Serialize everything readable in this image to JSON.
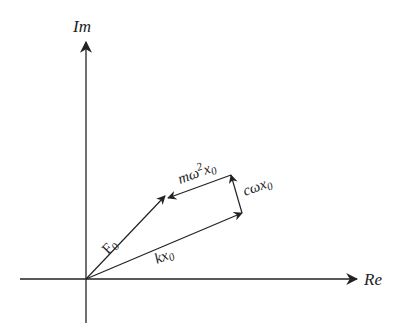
{
  "diagram": {
    "type": "phasor-diagram",
    "axes": {
      "imaginary_label": "Im",
      "real_label": "Re"
    },
    "vectors": [
      {
        "id": "F0",
        "label_main": "F",
        "label_sub": "0",
        "from": [
          86,
          279
        ],
        "to": [
          165,
          196
        ]
      },
      {
        "id": "kx0",
        "label_main": "kx",
        "label_sub": "0",
        "from": [
          86,
          279
        ],
        "to": [
          242,
          213
        ]
      },
      {
        "id": "cwx0",
        "label_main": "cωx",
        "label_sub": "0",
        "from": [
          242,
          213
        ],
        "to": [
          231,
          175
        ]
      },
      {
        "id": "mw2x0",
        "label_main": "mω",
        "label_sup": "2",
        "label_main2": "x",
        "label_sub": "0",
        "from": [
          231,
          175
        ],
        "to": [
          170,
          197
        ]
      }
    ],
    "colors": {
      "stroke": "#222222",
      "background": "#ffffff"
    }
  }
}
